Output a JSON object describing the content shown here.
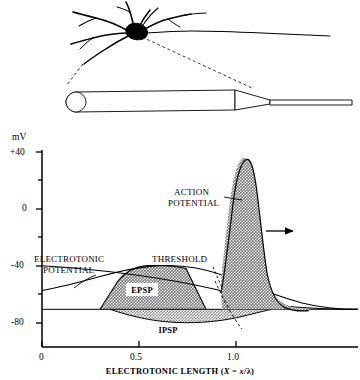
{
  "figure": {
    "diagram": {
      "name": "neuron-soma-and-cable-diagram",
      "soma_label": "soma",
      "cable_label": "dendrite-cable",
      "taper_label": "axon-taper",
      "axon_label": "axon"
    }
  },
  "chart_data": {
    "type": "line",
    "title": "",
    "xlabel_parts": {
      "main": "ELECTROTONIC LENGTH (",
      "italic_x_upper": "X",
      "equals": " = ",
      "italic_x_lower": "x",
      "slash": "/",
      "lambda": "λ",
      "close": ")"
    },
    "xlabel": "ELECTROTONIC LENGTH (X = x/λ)",
    "ylabel": "mV",
    "xlim": [
      0,
      1.62
    ],
    "ylim": [
      -95,
      40
    ],
    "xticks": [
      0,
      0.5,
      1.0
    ],
    "xtick_labels": [
      "0",
      "0.5",
      "1.0"
    ],
    "yticks": [
      40,
      20,
      0,
      -20,
      -40,
      -60,
      -80
    ],
    "ytick_labels": [
      "+40",
      "",
      "0",
      "",
      "-40",
      "",
      "-80"
    ],
    "grid": false,
    "legend_position": "none",
    "resting_potential_mV": -70,
    "threshold_potential_mV": -55,
    "peak_action_potential_mV": 30,
    "series": [
      {
        "name": "ELECTROTONIC POTENTIAL",
        "label": "ELECTROTONIC POTENTIAL",
        "label_line1": "ELECTROTONIC",
        "label_line2": "POTENTIAL",
        "description": "decaying passive potential spreading along the cable",
        "x": [
          0.0,
          0.2,
          0.4,
          0.55,
          0.7,
          0.85,
          1.0,
          1.15,
          1.3,
          1.45,
          1.6
        ],
        "y": [
          -62,
          -59,
          -56,
          -55,
          -56,
          -58,
          -61,
          -64,
          -67,
          -69,
          -70
        ]
      },
      {
        "name": "EPSP",
        "label": "EPSP",
        "description": "excitatory postsynaptic potential, shaded depolarizing hump",
        "x": [
          0.3,
          0.4,
          0.5,
          0.6,
          0.7,
          0.8,
          0.9
        ],
        "y": [
          -70,
          -60,
          -56,
          -55,
          -55,
          -60,
          -70
        ]
      },
      {
        "name": "IPSP",
        "label": "IPSP",
        "description": "inhibitory postsynaptic potential, shaded hyperpolarizing dip",
        "x": [
          0.35,
          0.5,
          0.65,
          0.8,
          0.95,
          1.1
        ],
        "y": [
          -70,
          -76,
          -78,
          -77,
          -73,
          -70
        ]
      },
      {
        "name": "ACTION POTENTIAL",
        "label": "ACTION POTENTIAL",
        "label_line1": "ACTION",
        "label_line2": "POTENTIAL",
        "description": "all-or-none spike with fast rise and slower falling phase",
        "x": [
          1.02,
          1.08,
          1.14,
          1.18,
          1.22,
          1.28,
          1.34,
          1.4,
          1.46,
          1.52,
          1.58
        ],
        "y": [
          -58,
          -30,
          10,
          28,
          30,
          14,
          -20,
          -50,
          -64,
          -69,
          -70
        ]
      },
      {
        "name": "THRESHOLD",
        "label": "THRESHOLD",
        "description": "threshold line that the depolarization must cross to trigger a spike",
        "x": [
          0.0,
          0.5,
          1.0,
          1.35,
          1.62
        ],
        "y": [
          -55,
          -57,
          -63,
          -68,
          -70
        ]
      }
    ],
    "annotations": [
      {
        "name": "propagation-arrow",
        "text": "",
        "symbol": "→",
        "description": "arrow showing direction of action potential propagation"
      }
    ],
    "colors": {
      "ink": "#000000",
      "shade_fill": "#a9a9a9",
      "shade_fill_light": "#b5b5b5",
      "background": "#ffffff"
    }
  }
}
